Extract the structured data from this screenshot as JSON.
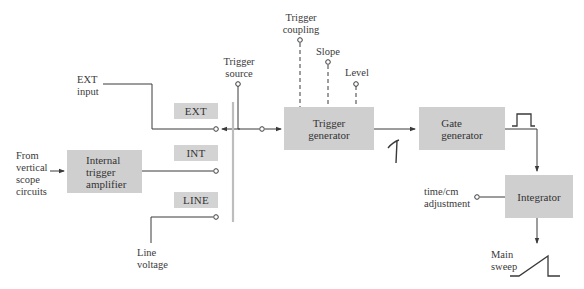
{
  "blocks": {
    "internal_trigger_amplifier": "Internal\ntrigger\namplifier",
    "trigger_generator": "Trigger\ngenerator",
    "gate_generator": "Gate\ngenerator",
    "integrator": "Integrator"
  },
  "source_tags": {
    "ext": "EXT",
    "int": "INT",
    "line": "LINE"
  },
  "labels": {
    "ext_input": "EXT\ninput",
    "from_vertical": "From\nvertical\nscope\ncircuits",
    "line_voltage": "Line\nvoltage",
    "trigger_source": "Trigger\nsource",
    "trigger_coupling": "Trigger\ncoupling",
    "slope": "Slope",
    "level": "Level",
    "time_cm": "time/cm\nadjustment",
    "main_sweep": "Main\nsweep"
  },
  "waveforms": {
    "trigger_pulse": "spike-waveform",
    "gate_pulse": "square-pulse-waveform",
    "sweep": "sawtooth-ramp-waveform"
  },
  "colors": {
    "block_fill": "#cfcfcf",
    "tag_fill": "#d3d3d3",
    "line": "#3a3a3a",
    "switch_bar": "#bdbdbd"
  }
}
